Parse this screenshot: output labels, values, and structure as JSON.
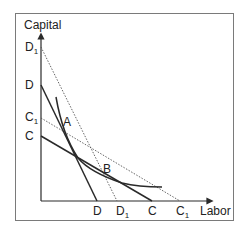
{
  "diagram": {
    "title": "",
    "axes": {
      "y_label": "Capital",
      "x_label": "Labor"
    },
    "y_intercepts": [
      {
        "label": "D",
        "sub": "1",
        "line": "D1"
      },
      {
        "label": "D",
        "sub": "",
        "line": "D"
      },
      {
        "label": "C",
        "sub": "1",
        "line": "C1"
      },
      {
        "label": "C",
        "sub": "",
        "line": "C"
      }
    ],
    "x_intercepts": [
      {
        "label": "D",
        "sub": "",
        "line": "D"
      },
      {
        "label": "D",
        "sub": "1",
        "line": "D1"
      },
      {
        "label": "C",
        "sub": "",
        "line": "C"
      },
      {
        "label": "C",
        "sub": "1",
        "line": "C1"
      }
    ],
    "points": [
      {
        "label": "A"
      },
      {
        "label": "B"
      }
    ],
    "lines": [
      {
        "name": "D",
        "style": "solid"
      },
      {
        "name": "D1",
        "style": "dotted"
      },
      {
        "name": "C",
        "style": "solid"
      },
      {
        "name": "C1",
        "style": "dotted"
      }
    ],
    "curve": {
      "name": "isoquant",
      "style": "solid"
    },
    "colors": {
      "line": "#2a2a2a",
      "dotted": "#555555",
      "frame": "#7a7a7a"
    }
  }
}
